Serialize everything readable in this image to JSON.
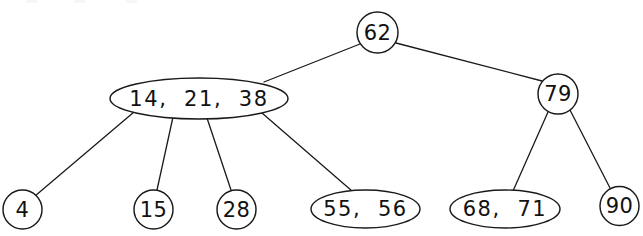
{
  "diagram": {
    "type": "multiway-search-tree",
    "background_color": "#ffffff",
    "stroke_color": "#1a1a1a",
    "text_color": "#111111",
    "nodes": [
      {
        "id": "root",
        "label": "62",
        "keys": [
          "62"
        ],
        "shape": "circle",
        "level": 0,
        "cx": 377.5,
        "cy": 32.5,
        "rx": 20.5,
        "ry": 20.5
      },
      {
        "id": "internal-left",
        "label": "14,  21,  38",
        "keys": [
          "14",
          "21",
          "38"
        ],
        "shape": "ellipse",
        "level": 1,
        "cx": 199,
        "cy": 98.5,
        "rx": 89,
        "ry": 20.5
      },
      {
        "id": "internal-right",
        "label": "79",
        "keys": [
          "79"
        ],
        "shape": "circle",
        "level": 1,
        "cx": 558,
        "cy": 94,
        "rx": 20,
        "ry": 20
      },
      {
        "id": "leaf-4",
        "label": "4",
        "keys": [
          "4"
        ],
        "shape": "circle",
        "level": 2,
        "cx": 22.5,
        "cy": 209.5,
        "rx": 19.5,
        "ry": 19.5
      },
      {
        "id": "leaf-15",
        "label": "15",
        "keys": [
          "15"
        ],
        "shape": "circle",
        "level": 2,
        "cx": 153.5,
        "cy": 209.5,
        "rx": 19.5,
        "ry": 19.5
      },
      {
        "id": "leaf-28",
        "label": "28",
        "keys": [
          "28"
        ],
        "shape": "circle",
        "level": 2,
        "cx": 236.5,
        "cy": 209.5,
        "rx": 19.5,
        "ry": 19.5
      },
      {
        "id": "leaf-55-56",
        "label": "55,  56",
        "keys": [
          "55",
          "56"
        ],
        "shape": "ellipse",
        "level": 2,
        "cx": 365.5,
        "cy": 209,
        "rx": 54.5,
        "ry": 19
      },
      {
        "id": "leaf-68-71",
        "label": "68,  71",
        "keys": [
          "68",
          "71"
        ],
        "shape": "ellipse",
        "level": 2,
        "cx": 505,
        "cy": 209,
        "rx": 55,
        "ry": 19
      },
      {
        "id": "leaf-90",
        "label": "90",
        "keys": [
          "90"
        ],
        "shape": "circle",
        "level": 2,
        "cx": 619.5,
        "cy": 206,
        "rx": 19.5,
        "ry": 19.5
      }
    ],
    "edges": [
      {
        "id": "edge-root-left",
        "from": "root",
        "to": "internal-left",
        "x1": 360,
        "y1": 44,
        "x2": 264,
        "y2": 82
      },
      {
        "id": "edge-root-right",
        "from": "root",
        "to": "internal-right",
        "x1": 396,
        "y1": 43,
        "x2": 542,
        "y2": 81
      },
      {
        "id": "edge-left-4",
        "from": "internal-left",
        "to": "leaf-4",
        "x1": 134,
        "y1": 112,
        "x2": 35,
        "y2": 196
      },
      {
        "id": "edge-left-15",
        "from": "internal-left",
        "to": "leaf-15",
        "x1": 173,
        "y1": 117,
        "x2": 157,
        "y2": 190
      },
      {
        "id": "edge-left-28",
        "from": "internal-left",
        "to": "leaf-28",
        "x1": 207,
        "y1": 118,
        "x2": 231,
        "y2": 190
      },
      {
        "id": "edge-left-5556",
        "from": "internal-left",
        "to": "leaf-55-56",
        "x1": 262,
        "y1": 113,
        "x2": 352,
        "y2": 191
      },
      {
        "id": "edge-right-6871",
        "from": "internal-right",
        "to": "leaf-68-71",
        "x1": 548,
        "y1": 112,
        "x2": 513,
        "y2": 191
      },
      {
        "id": "edge-right-90",
        "from": "internal-right",
        "to": "leaf-90",
        "x1": 570,
        "y1": 110,
        "x2": 610,
        "y2": 188
      }
    ]
  }
}
